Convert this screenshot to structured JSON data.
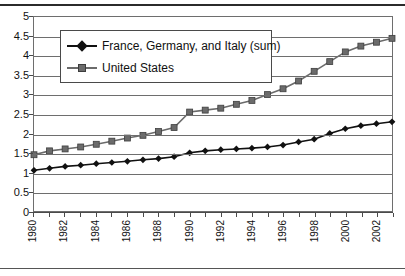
{
  "chart_data": {
    "type": "line",
    "title": "",
    "xlabel": "",
    "ylabel": "",
    "ylim": [
      0,
      5
    ],
    "ytick_step": 0.5,
    "ytick_labels": [
      "0",
      "0.5",
      "1",
      "1.5",
      "2",
      "2.5",
      "3",
      "3.5",
      "4",
      "4.5",
      "5"
    ],
    "grid": true,
    "legend_position": "upper-left-inside",
    "x": [
      1980,
      1981,
      1982,
      1983,
      1984,
      1985,
      1986,
      1987,
      1988,
      1989,
      1990,
      1991,
      1992,
      1993,
      1994,
      1995,
      1996,
      1997,
      1998,
      1999,
      2000,
      2001,
      2002,
      2003
    ],
    "xtick_labels": [
      "1980",
      "1982",
      "1984",
      "1986",
      "1988",
      "1990",
      "1992",
      "1994",
      "1996",
      "1998",
      "2000",
      "2002"
    ],
    "xtick_label_years": [
      1980,
      1982,
      1984,
      1986,
      1988,
      1990,
      1992,
      1994,
      1996,
      1998,
      2000,
      2002
    ],
    "series": [
      {
        "name": "France, Germany, and Italy (sum)",
        "marker": "diamond",
        "color": "#111111",
        "values": [
          1.05,
          1.1,
          1.15,
          1.18,
          1.22,
          1.25,
          1.28,
          1.32,
          1.35,
          1.4,
          1.5,
          1.55,
          1.58,
          1.6,
          1.62,
          1.65,
          1.7,
          1.78,
          1.85,
          2.0,
          2.12,
          2.2,
          2.25,
          2.3
        ]
      },
      {
        "name": "United States",
        "marker": "square",
        "color": "#6b6b6b",
        "values": [
          1.45,
          1.55,
          1.6,
          1.65,
          1.72,
          1.8,
          1.88,
          1.95,
          2.05,
          2.15,
          2.55,
          2.6,
          2.65,
          2.75,
          2.85,
          3.0,
          3.15,
          3.35,
          3.6,
          3.85,
          4.1,
          4.25,
          4.35,
          4.45
        ]
      }
    ]
  },
  "legend": {
    "entries": [
      {
        "label": "France, Germany, and Italy (sum)"
      },
      {
        "label": "United States"
      }
    ]
  }
}
